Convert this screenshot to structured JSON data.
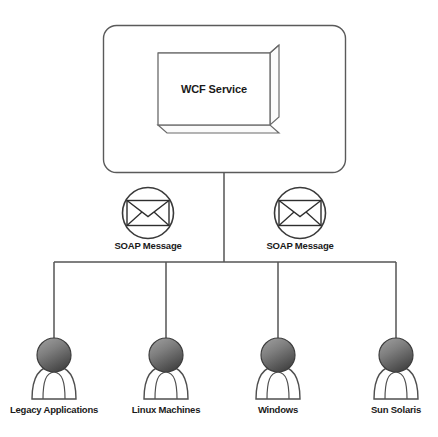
{
  "diagram": {
    "service": {
      "label": "WCF Service",
      "icon": "3d-box-icon"
    },
    "messages": [
      {
        "label": "SOAP Message",
        "icon": "envelope-icon"
      },
      {
        "label": "SOAP Message",
        "icon": "envelope-icon"
      }
    ],
    "clients": [
      {
        "label": "Legacy Applications",
        "icon": "person-icon"
      },
      {
        "label": "Linux Machines",
        "icon": "person-icon"
      },
      {
        "label": "Windows",
        "icon": "person-icon"
      },
      {
        "label": "Sun Solaris",
        "icon": "person-icon"
      }
    ],
    "colors": {
      "stroke": "#4d4d4d",
      "line": "#555555",
      "text": "#1a1a1a",
      "head_light": "#9a9a9a",
      "head_dark": "#4a4a4a",
      "body_fill": "#ffffff",
      "background": "#ffffff"
    }
  }
}
